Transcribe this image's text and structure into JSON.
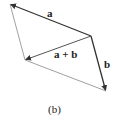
{
  "diagram": {
    "type": "vector-parallelogram",
    "vertices": {
      "top_left": [
        10,
        4
      ],
      "right": [
        91,
        36
      ],
      "bottom_right": [
        106,
        91
      ],
      "left": [
        25,
        60
      ]
    },
    "vectors": [
      {
        "id": "a",
        "label": "a",
        "from": [
          91,
          36
        ],
        "to": [
          10,
          4
        ],
        "style": "bold-arrow"
      },
      {
        "id": "b",
        "label": "b",
        "from": [
          91,
          36
        ],
        "to": [
          106,
          91
        ],
        "style": "bold-arrow"
      },
      {
        "id": "a_plus_b",
        "label": "a + b",
        "from": [
          91,
          36
        ],
        "to": [
          25,
          60
        ],
        "style": "arrow"
      }
    ],
    "edges": [
      {
        "from": [
          10,
          4
        ],
        "to": [
          25,
          60
        ]
      },
      {
        "from": [
          25,
          60
        ],
        "to": [
          106,
          91
        ]
      }
    ],
    "colors": {
      "vector": "#333333",
      "edge": "#777777",
      "text": "#222222"
    },
    "caption": "(b)"
  }
}
